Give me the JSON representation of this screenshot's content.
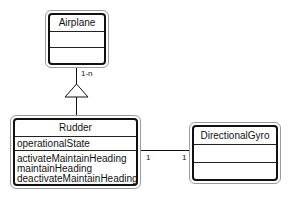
{
  "diagram": {
    "type": "UML class diagram",
    "classes": [
      {
        "id": "airplane",
        "name": "Airplane",
        "attributes": [],
        "operations": []
      },
      {
        "id": "rudder",
        "name": "Rudder",
        "attributes": [
          "operationalState"
        ],
        "operations": [
          "activateMaintainHeading",
          "maintainHeading",
          "deactivateMaintainHeading"
        ]
      },
      {
        "id": "directionalgyro",
        "name": "DirectionalGyro",
        "attributes": [],
        "operations": []
      }
    ],
    "relationships": [
      {
        "type": "generalization",
        "from": "Rudder",
        "to": "Airplane",
        "multiplicity": "1-n"
      },
      {
        "type": "association",
        "from": "Rudder",
        "to": "DirectionalGyro",
        "multiplicity_from": "1",
        "multiplicity_to": "1"
      }
    ]
  },
  "labels": {
    "airplane_name": "Airplane",
    "rudder_name": "Rudder",
    "rudder_attribute_0": "operationalState",
    "rudder_operation_0": "activateMaintainHeading",
    "rudder_operation_1": "maintainHeading",
    "rudder_operation_2": "deactivateMaintainHeading",
    "gyro_name": "DirectionalGyro",
    "generalization_multiplicity": "1-n",
    "assoc_mult_rudder": "1",
    "assoc_mult_gyro": "1"
  },
  "colors": {
    "line": "#111111",
    "shadow_border": "#9a9a9a",
    "background": "#ffffff"
  }
}
